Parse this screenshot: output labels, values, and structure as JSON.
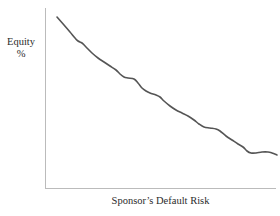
{
  "figure": {
    "width": 280,
    "height": 216,
    "background_color": "#ffffff"
  },
  "labels": {
    "y_axis_line1": "Equity",
    "y_axis_line2": "%",
    "x_axis": "Sponsor’s Default Risk"
  },
  "style": {
    "axis_color": "#bbbbbb",
    "curve_color": "#555555",
    "text_color": "#2b2b2b"
  },
  "chart_data": {
    "type": "line",
    "title": "",
    "subtitle": "",
    "xlabel": "Sponsor’s Default Risk",
    "ylabel": "Equity %",
    "grid": false,
    "legend": "none",
    "axis_ticks": "none",
    "xlim": [
      0,
      100
    ],
    "ylim": [
      0,
      100
    ],
    "annotations": [],
    "series": [
      {
        "name": "Equity %",
        "description": "Monotonically decreasing stepped curve: equity percentage falls as sponsor default risk rises",
        "x": [
          5,
          10,
          13,
          15,
          18,
          22,
          26,
          30,
          33,
          36,
          39,
          42,
          46,
          50,
          54,
          58,
          62,
          66,
          70,
          74,
          78,
          82,
          86,
          89,
          91,
          94,
          97,
          100
        ],
        "y": [
          94,
          88,
          84,
          80,
          79,
          74,
          70,
          67,
          66,
          61,
          58,
          57,
          53,
          50,
          48,
          45,
          41,
          37,
          36,
          33,
          29,
          24,
          21,
          18,
          15,
          14,
          15,
          15
        ]
      }
    ],
    "pixel_path": [
      [
        57,
        17
      ],
      [
        64,
        25
      ],
      [
        70,
        32
      ],
      [
        75,
        38
      ],
      [
        78,
        41
      ],
      [
        82,
        43
      ],
      [
        86,
        47
      ],
      [
        92,
        53
      ],
      [
        98,
        58
      ],
      [
        104,
        62
      ],
      [
        110,
        66
      ],
      [
        116,
        70
      ],
      [
        120,
        74
      ],
      [
        124,
        77
      ],
      [
        128,
        78
      ],
      [
        134,
        79
      ],
      [
        138,
        83
      ],
      [
        142,
        88
      ],
      [
        146,
        91
      ],
      [
        150,
        93
      ],
      [
        156,
        95
      ],
      [
        160,
        97
      ],
      [
        164,
        101
      ],
      [
        170,
        106
      ],
      [
        176,
        110
      ],
      [
        182,
        113
      ],
      [
        188,
        116
      ],
      [
        194,
        120
      ],
      [
        199,
        124
      ],
      [
        204,
        127
      ],
      [
        210,
        128
      ],
      [
        216,
        129
      ],
      [
        220,
        131
      ],
      [
        226,
        136
      ],
      [
        232,
        140
      ],
      [
        238,
        144
      ],
      [
        243,
        147
      ],
      [
        247,
        151
      ],
      [
        251,
        153
      ],
      [
        256,
        153
      ],
      [
        262,
        152
      ],
      [
        268,
        152
      ],
      [
        272,
        153
      ],
      [
        277,
        155
      ]
    ]
  }
}
